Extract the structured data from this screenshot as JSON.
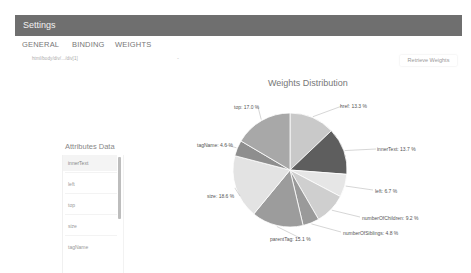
{
  "header": {
    "title": "Settings"
  },
  "tabs": [
    {
      "label": "GENERAL"
    },
    {
      "label": "BINDING"
    },
    {
      "label": "WEIGHTS",
      "active": true
    }
  ],
  "selector": {
    "value": "html/body/div/.../div[1]",
    "caret": "-"
  },
  "retrieve_button": {
    "label": "Retrieve Weights"
  },
  "attributes": {
    "title": "Attributes Data",
    "items": [
      {
        "label": "innerText",
        "selected": true
      },
      {
        "label": "left"
      },
      {
        "label": "top"
      },
      {
        "label": "size"
      },
      {
        "label": "tagName"
      }
    ]
  },
  "colors": {
    "header_bg": "#6f6f6f",
    "header_text": "#f2f2f2",
    "scrollbar": "#bdbdbd"
  },
  "chart_data": {
    "type": "pie",
    "title": "Weights Distribution",
    "categories": [
      "href",
      "innerText",
      "left",
      "numberOfChildren",
      "numberOfSiblings",
      "parentTag",
      "size",
      "tagName",
      "top"
    ],
    "values": [
      13.3,
      13.7,
      6.7,
      9.2,
      4.8,
      15.1,
      18.6,
      4.6,
      17.0
    ],
    "labels": [
      "href: 13.3 %",
      "innerText: 13.7 %",
      "left: 6.7 %",
      "numberOfChildren: 9.2 %",
      "numberOfSiblings: 4.8 %",
      "parentTag: 15.1 %",
      "size: 18.6 %",
      "tagName: 4.6 %",
      "top: 17.0 %"
    ],
    "colors": [
      "#c9c9c9",
      "#5e5e5e",
      "#e6e6e6",
      "#cfcfcf",
      "#9a9a9a",
      "#9c9c9c",
      "#e3e3e3",
      "#8e8e8e",
      "#a8a8a8"
    ],
    "start_angle_deg": 0,
    "direction": "clockwise",
    "legend": "none"
  }
}
